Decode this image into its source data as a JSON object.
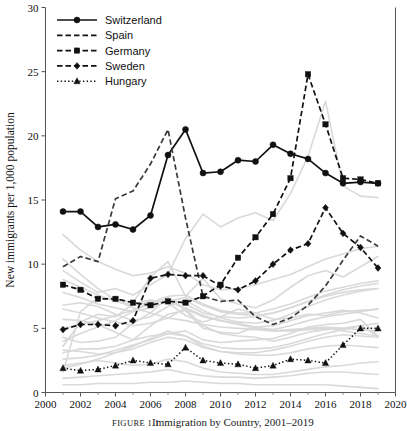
{
  "figure": {
    "caption_lead": "FIGURE 1.1",
    "caption_text": "Immigration by Country, 2001–2019",
    "background_color": "#ffffff",
    "highlight_color": "#111111",
    "context_color": "#d9d9d9"
  },
  "chart_data": {
    "type": "line",
    "title": "",
    "xlabel": "",
    "ylabel": "New immigrants per 1,000 population",
    "xlim": [
      2000,
      2020
    ],
    "ylim": [
      0,
      30
    ],
    "xticks": [
      2000,
      2002,
      2004,
      2006,
      2008,
      2010,
      2012,
      2014,
      2016,
      2018,
      2020
    ],
    "xtick_labels": [
      "2000",
      "2002",
      "2004",
      "2006",
      "2008",
      "2010",
      "2012",
      "2014",
      "2016",
      "2018",
      "2020"
    ],
    "yticks": [
      0,
      5,
      10,
      15,
      20,
      25,
      30
    ],
    "ytick_labels": [
      "0",
      "5",
      "10",
      "15",
      "20",
      "25",
      "30"
    ],
    "xminorticks": [
      2001,
      2003,
      2005,
      2007,
      2009,
      2011,
      2013,
      2015,
      2017,
      2019
    ],
    "grid": false,
    "legend_position": "top-left",
    "x": [
      2001,
      2002,
      2003,
      2004,
      2005,
      2006,
      2007,
      2008,
      2009,
      2010,
      2011,
      2012,
      2013,
      2014,
      2015,
      2016,
      2017,
      2018,
      2019
    ],
    "series": [
      {
        "name": "Switzerland",
        "style": "solid",
        "marker": "circle",
        "color": "#111111",
        "values": [
          14.1,
          14.1,
          12.9,
          13.1,
          12.7,
          13.8,
          18.5,
          20.5,
          17.1,
          17.2,
          18.1,
          18.0,
          19.3,
          18.6,
          18.2,
          17.1,
          16.3,
          16.4,
          16.3
        ]
      },
      {
        "name": "Spain",
        "style": "dashed",
        "marker": "none",
        "color": "#3a3a3a",
        "values": [
          9.8,
          10.6,
          10.2,
          15.1,
          15.7,
          17.8,
          20.5,
          13.6,
          7.5,
          7.1,
          7.2,
          5.9,
          5.3,
          5.8,
          6.8,
          8.3,
          10.3,
          12.2,
          11.4
        ]
      },
      {
        "name": "Germany",
        "style": "dashed",
        "marker": "square",
        "color": "#111111",
        "values": [
          8.4,
          8.0,
          7.3,
          7.3,
          7.0,
          6.8,
          7.1,
          7.0,
          7.5,
          8.4,
          10.5,
          12.1,
          13.9,
          16.7,
          24.8,
          20.9,
          16.7,
          16.6,
          16.3
        ]
      },
      {
        "name": "Sweden",
        "style": "dashed",
        "marker": "diamond",
        "color": "#111111",
        "values": [
          4.9,
          5.3,
          5.3,
          5.2,
          5.6,
          8.9,
          9.2,
          9.1,
          9.1,
          8.3,
          8.0,
          8.7,
          10.0,
          11.1,
          11.6,
          14.4,
          12.4,
          11.3,
          9.7
        ]
      },
      {
        "name": "Hungary",
        "style": "dotted",
        "marker": "triangle",
        "color": "#111111",
        "values": [
          1.9,
          1.7,
          1.8,
          2.1,
          2.5,
          2.3,
          2.2,
          3.5,
          2.5,
          2.3,
          2.2,
          1.9,
          2.1,
          2.6,
          2.5,
          2.3,
          3.7,
          5.0,
          5.0
        ]
      }
    ],
    "context_series": [
      {
        "name": "context-01",
        "values": [
          1.6,
          6.3,
          7.4,
          7.3,
          7.0,
          9.0,
          10.2,
          7.5,
          8.9,
          7.3,
          6.9,
          6.6,
          7.2,
          8.2,
          9.1,
          9.5,
          9.0,
          9.8,
          10.6
        ]
      },
      {
        "name": "context-02",
        "values": [
          9.5,
          8.6,
          7.8,
          8.1,
          7.6,
          8.4,
          9.2,
          12.0,
          13.9,
          12.9,
          13.6,
          14.0,
          13.4,
          15.5,
          18.4,
          22.7,
          16.1,
          15.3,
          15.2
        ]
      },
      {
        "name": "context-03",
        "values": [
          5.7,
          5.6,
          5.3,
          4.7,
          4.1,
          5.2,
          6.1,
          6.4,
          5.0,
          4.7,
          4.6,
          5.1,
          5.2,
          5.6,
          6.0,
          6.2,
          6.4,
          6.2,
          5.8
        ]
      },
      {
        "name": "context-04",
        "values": [
          3.1,
          3.4,
          3.4,
          3.6,
          4.1,
          4.4,
          4.6,
          4.8,
          4.1,
          3.9,
          4.0,
          4.1,
          4.2,
          4.6,
          5.1,
          5.3,
          5.4,
          5.7,
          4.4
        ]
      },
      {
        "name": "context-05",
        "values": [
          4.3,
          3.9,
          4.0,
          4.3,
          5.4,
          6.2,
          7.4,
          6.5,
          5.2,
          4.6,
          4.4,
          4.3,
          4.0,
          4.3,
          4.7,
          4.9,
          5.0,
          5.2,
          4.4
        ]
      },
      {
        "name": "context-06",
        "values": [
          3.6,
          5.5,
          6.1,
          5.9,
          6.9,
          7.2,
          7.0,
          6.0,
          5.5,
          5.9,
          6.5,
          6.2,
          5.7,
          5.8,
          6.1,
          6.0,
          6.3,
          6.4,
          6.5
        ]
      },
      {
        "name": "context-07",
        "values": [
          0.6,
          0.6,
          0.7,
          0.7,
          0.7,
          0.8,
          0.8,
          0.9,
          0.8,
          0.7,
          0.7,
          0.6,
          0.6,
          0.6,
          0.6,
          0.6,
          0.5,
          0.4,
          0.3
        ]
      },
      {
        "name": "context-08",
        "values": [
          1.1,
          1.2,
          1.3,
          1.4,
          1.5,
          1.6,
          1.8,
          1.5,
          1.3,
          1.2,
          1.2,
          1.1,
          1.2,
          1.3,
          1.5,
          1.6,
          1.6,
          1.5,
          1.4
        ]
      },
      {
        "name": "context-09",
        "values": [
          2.1,
          2.3,
          2.5,
          2.3,
          2.1,
          2.2,
          2.6,
          2.4,
          1.9,
          1.6,
          1.5,
          1.4,
          1.4,
          1.6,
          1.8,
          2.0,
          2.1,
          2.3,
          2.4
        ]
      },
      {
        "name": "context-10",
        "values": [
          6.5,
          6.2,
          5.8,
          5.5,
          5.2,
          5.4,
          5.8,
          6.6,
          6.0,
          5.6,
          5.4,
          5.1,
          4.9,
          5.2,
          5.6,
          5.9,
          6.1,
          6.3,
          6.5
        ]
      },
      {
        "name": "context-11",
        "values": [
          10.4,
          9.2,
          8.1,
          7.2,
          6.6,
          6.2,
          5.8,
          5.6,
          5.3,
          5.1,
          5.0,
          4.9,
          4.8,
          4.9,
          5.0,
          5.1,
          5.0,
          4.9,
          4.8
        ]
      },
      {
        "name": "context-12",
        "values": [
          4.0,
          4.6,
          5.1,
          5.6,
          6.3,
          7.1,
          7.1,
          6.5,
          5.9,
          5.6,
          5.3,
          5.0,
          4.8,
          4.8,
          4.9,
          5.0,
          4.8,
          4.6,
          4.4
        ]
      },
      {
        "name": "context-13",
        "values": [
          2.6,
          2.7,
          2.9,
          3.3,
          3.7,
          4.1,
          4.6,
          4.4,
          3.6,
          3.2,
          3.0,
          2.9,
          2.9,
          3.1,
          3.4,
          3.6,
          3.7,
          3.6,
          3.5
        ]
      },
      {
        "name": "context-14",
        "values": [
          7.8,
          7.4,
          6.9,
          6.6,
          6.3,
          6.6,
          7.1,
          7.4,
          6.8,
          6.3,
          6.1,
          6.0,
          6.2,
          6.6,
          7.1,
          7.6,
          8.0,
          8.3,
          8.5
        ]
      },
      {
        "name": "context-15",
        "values": [
          12.3,
          11.1,
          10.2,
          9.6,
          9.1,
          9.3,
          9.8,
          9.3,
          8.4,
          8.0,
          8.1,
          8.4,
          8.8,
          9.2,
          9.8,
          10.4,
          10.8,
          11.2,
          11.4
        ]
      },
      {
        "name": "context-16",
        "values": [
          1.9,
          2.2,
          2.6,
          3.1,
          3.6,
          4.2,
          4.8,
          4.4,
          3.8,
          3.5,
          3.4,
          3.4,
          3.5,
          3.8,
          4.2,
          4.6,
          4.9,
          5.2,
          5.4
        ]
      },
      {
        "name": "context-17",
        "values": [
          5.0,
          5.3,
          5.6,
          6.0,
          6.4,
          6.9,
          7.3,
          6.9,
          6.2,
          5.9,
          5.8,
          5.9,
          6.2,
          6.6,
          7.1,
          7.5,
          7.8,
          8.0,
          8.1
        ]
      },
      {
        "name": "context-18",
        "values": [
          6.8,
          7.0,
          6.7,
          6.1,
          5.6,
          5.9,
          6.7,
          7.2,
          6.4,
          5.8,
          5.5,
          5.4,
          5.6,
          6.1,
          6.7,
          7.2,
          7.6,
          7.9,
          8.1
        ]
      },
      {
        "name": "context-19",
        "values": [
          3.3,
          3.2,
          3.0,
          3.1,
          3.4,
          3.9,
          4.3,
          4.1,
          3.5,
          3.2,
          3.1,
          3.1,
          3.3,
          3.6,
          4.0,
          4.3,
          4.5,
          4.4,
          4.3
        ]
      },
      {
        "name": "context-20",
        "values": [
          8.8,
          8.2,
          7.6,
          7.1,
          6.8,
          7.0,
          7.5,
          7.6,
          6.9,
          6.4,
          6.2,
          6.2,
          6.5,
          6.9,
          7.4,
          7.9,
          8.2,
          8.5,
          8.7
        ]
      }
    ]
  },
  "legend": {
    "items": [
      {
        "label": "Switzerland",
        "style": "solid",
        "marker": "circle"
      },
      {
        "label": "Spain",
        "style": "dashed",
        "marker": "none"
      },
      {
        "label": "Germany",
        "style": "dashed",
        "marker": "square"
      },
      {
        "label": "Sweden",
        "style": "dashed",
        "marker": "diamond"
      },
      {
        "label": "Hungary",
        "style": "dotted",
        "marker": "triangle"
      }
    ]
  }
}
